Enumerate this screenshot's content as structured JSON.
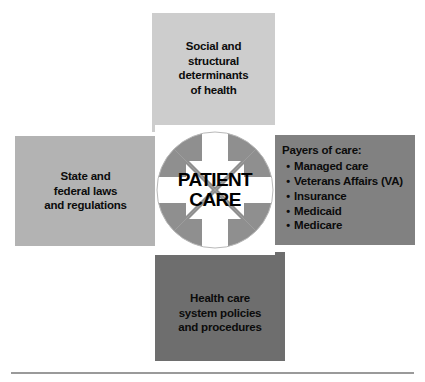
{
  "diagram": {
    "center": {
      "label_line1": "PATIENT",
      "label_line2": "CARE",
      "icon": "four-inward-arrows-circle"
    },
    "boxes": {
      "top": {
        "name": "social-structural-determinants",
        "lines": [
          "Social and",
          "structural",
          "determinants",
          "of health"
        ],
        "color": "#cdcdcd"
      },
      "left": {
        "name": "state-federal-laws",
        "lines": [
          "State and",
          "federal laws",
          "and regulations"
        ],
        "color": "#b3b3b3"
      },
      "right": {
        "name": "payers-of-care",
        "title": "Payers of care:",
        "bullet": "•",
        "items": [
          "Managed care",
          "Veterans Affairs (VA)",
          "Insurance",
          "Medicaid",
          "Medicare"
        ],
        "color": "#818181"
      },
      "bottom": {
        "name": "health-care-system-policies",
        "lines": [
          "Health care",
          "system policies",
          "and procedures"
        ],
        "color": "#6e6e6e"
      }
    },
    "rule_color": "#9a9a9a"
  }
}
